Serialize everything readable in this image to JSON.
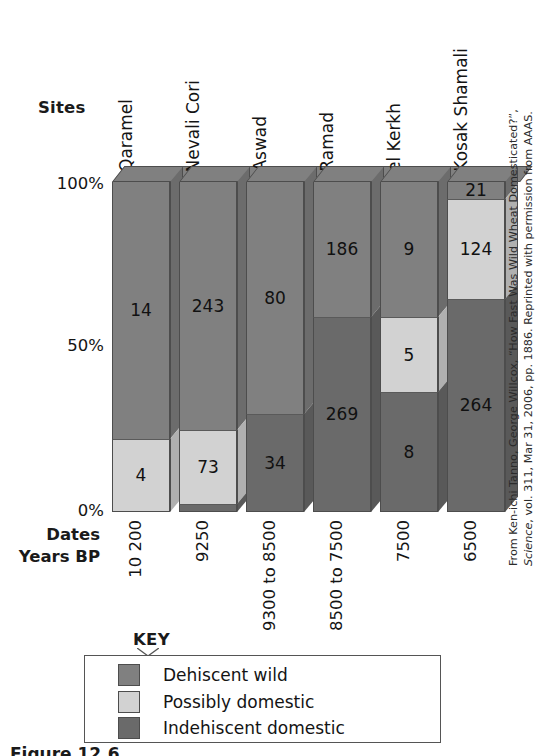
{
  "figure": {
    "sites_axis_label": "Sites",
    "dates_axis_label_line1": "Dates",
    "dates_axis_label_line2": "Years BP",
    "key_label": "KEY",
    "caption_clipped": "Figure 12.6",
    "credit": "From Ken-ichi Tanno, George Willcox, “How Fast Was Wild Wheat Domesticated?”, ",
    "credit_italic": "Science",
    "credit_tail": ", vol. 311, Mar 31, 2006, pp. 1886. Reprinted with permission from AAAS."
  },
  "colors": {
    "dehiscent_wild": "#808080",
    "possibly_domestic": "#d2d2d2",
    "indehiscent_domestic": "#6a6a6a",
    "outline": "#4d4d4d",
    "background": "#ffffff",
    "text": "#141414"
  },
  "chart_data": {
    "type": "bar",
    "subtype": "100% stacked (3-D)",
    "title": "",
    "xlabel": "Sites",
    "ylabel": "",
    "ylim": [
      0,
      100
    ],
    "ytick_labels": [
      "100%",
      "50%",
      "0%"
    ],
    "yticks": [
      100,
      50,
      0
    ],
    "grid": false,
    "legend_position": "bottom",
    "categories": [
      "Qaramel",
      "Nevali Cori",
      "Aswad",
      "Ramad",
      "el Kerkh",
      "Kosak Shamali"
    ],
    "dates_years_bp": [
      "10 200",
      "9250",
      "9300 to 8500",
      "8500 to 7500",
      "7500",
      "6500"
    ],
    "series": [
      {
        "name": "Dehiscent wild",
        "color": "#808080",
        "values": [
          14,
          243,
          80,
          186,
          9,
          21
        ],
        "percent": [
          77.8,
          75.0,
          70.2,
          40.9,
          40.9,
          5.1
        ]
      },
      {
        "name": "Possibly domestic",
        "color": "#d2d2d2",
        "values": [
          4,
          73,
          0,
          0,
          5,
          124
        ],
        "percent": [
          22.2,
          22.5,
          0,
          0,
          22.7,
          30.3
        ]
      },
      {
        "name": "Indehiscent domestic",
        "color": "#6a6a6a",
        "values": [
          0,
          8,
          34,
          269,
          8,
          264
        ],
        "percent": [
          0,
          2.5,
          29.8,
          59.1,
          36.4,
          64.6
        ]
      }
    ],
    "value_labels_shown": {
      "Qaramel": {
        "Dehiscent wild": "14",
        "Possibly domestic": "4",
        "Indehiscent domestic": ""
      },
      "Nevali Cori": {
        "Dehiscent wild": "243",
        "Possibly domestic": "73",
        "Indehiscent domestic": ""
      },
      "Aswad": {
        "Dehiscent wild": "80",
        "Possibly domestic": "",
        "Indehiscent domestic": "34"
      },
      "Ramad": {
        "Dehiscent wild": "186",
        "Possibly domestic": "",
        "Indehiscent domestic": "269"
      },
      "el Kerkh": {
        "Dehiscent wild": "9",
        "Possibly domestic": "5",
        "Indehiscent domestic": "8"
      },
      "Kosak Shamali": {
        "Dehiscent wild": "21",
        "Possibly domestic": "124",
        "Indehiscent domestic": "264"
      }
    }
  },
  "legend": {
    "items": [
      {
        "label": "Dehiscent wild",
        "color": "#808080"
      },
      {
        "label": "Possibly domestic",
        "color": "#d2d2d2"
      },
      {
        "label": "Indehiscent domestic",
        "color": "#6a6a6a"
      }
    ]
  }
}
